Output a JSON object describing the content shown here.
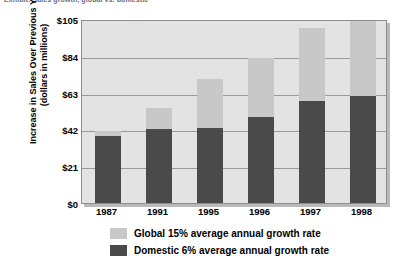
{
  "top_caption": "Exhibit: Sales growth, global vs. domestic",
  "chart_data": {
    "type": "bar",
    "subtype": "stacked-bar",
    "title": "",
    "xlabel": "",
    "ylabel": "Increase in Sales Over Previous Year (dollars in millions)",
    "ylabel_line1": "Increase in Sales Over Previous Year",
    "ylabel_line2": "(dollars in millions)",
    "categories": [
      "1987",
      "1991",
      "1995",
      "1996",
      "1997",
      "1998"
    ],
    "ylim": [
      0,
      105
    ],
    "yticks": [
      0,
      21,
      42,
      63,
      84,
      105
    ],
    "ytick_labels": [
      "$0",
      "$21",
      "$42",
      "$63",
      "$84",
      "$105"
    ],
    "grid": true,
    "legend_position": "bottom-left",
    "series": [
      {
        "name": "Domestic 6% average annual growth rate",
        "color": "#4a4a4a",
        "values": [
          38,
          42,
          43,
          49,
          58,
          61
        ]
      },
      {
        "name": "Global 15% average annual growth rate",
        "color": "#c8c8c8",
        "values": [
          3,
          12,
          28,
          34,
          42,
          43
        ]
      }
    ],
    "totals": [
      41,
      54,
      71,
      83,
      100,
      104
    ]
  },
  "legend": {
    "items": [
      {
        "label": "Global 15% average annual growth rate",
        "color": "#c8c8c8"
      },
      {
        "label": "Domestic 6% average annual growth rate",
        "color": "#4a4a4a"
      }
    ]
  },
  "colors": {
    "plot_background": "#e3e3e3",
    "gridline": "#9a9a9a",
    "global": "#c8c8c8",
    "domestic": "#4a4a4a"
  }
}
